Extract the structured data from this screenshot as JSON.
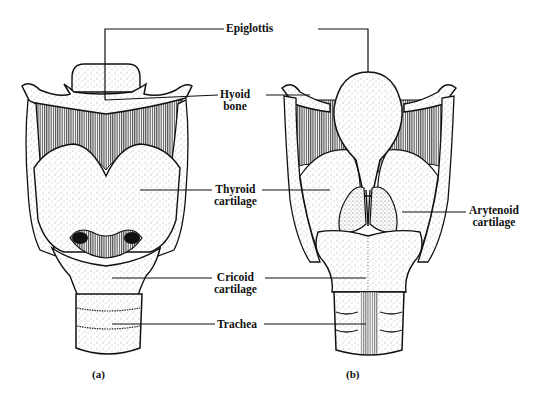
{
  "figure": {
    "labels": {
      "epiglottis": "Epiglottis",
      "hyoid_bone": [
        "Hyoid",
        "bone"
      ],
      "thyroid_cartilage": [
        "Thyroid",
        "cartilage"
      ],
      "arytenoid_cartilage": [
        "Arytenoid",
        "cartilage"
      ],
      "cricoid_cartilage": [
        "Cricoid",
        "cartilage"
      ],
      "trachea": "Trachea"
    },
    "captions": {
      "left": "(a)",
      "right": "(b)"
    },
    "colors": {
      "ink": "#111111",
      "stipple": "#555555",
      "paper": "#ffffff"
    }
  }
}
